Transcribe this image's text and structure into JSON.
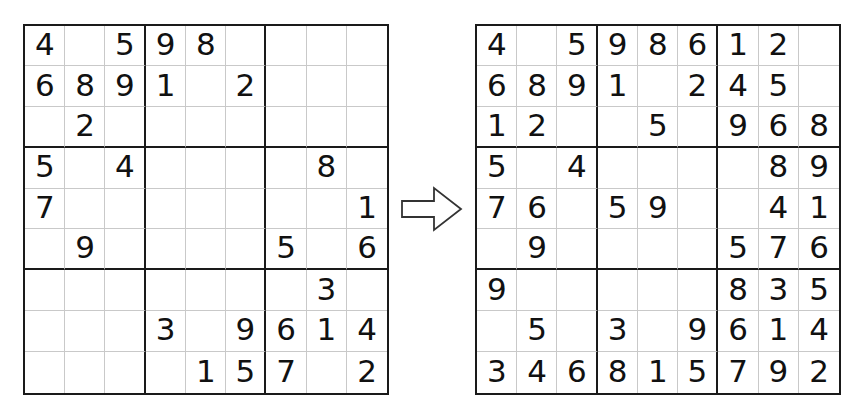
{
  "figure": {
    "arrow": {
      "name": "right-arrow",
      "direction": "right",
      "fill": "#ffffff",
      "stroke": "#333333"
    },
    "colors": {
      "page_background": "#ffffff",
      "grid_outer_border": "#1a1a1a",
      "grid_box_border": "#1a1a1a",
      "grid_cell_border": "#c9c9c9",
      "digit": "#111111"
    }
  },
  "grids": [
    {
      "name": "puzzle",
      "label": "Sudoku puzzle (givens)",
      "size": 9,
      "rows": [
        [
          "4",
          "",
          "5",
          "9",
          "8",
          "",
          "",
          "",
          ""
        ],
        [
          "6",
          "8",
          "9",
          "1",
          "",
          "2",
          "",
          "",
          ""
        ],
        [
          "",
          "2",
          "",
          "",
          "",
          "",
          "",
          "",
          ""
        ],
        [
          "5",
          "",
          "4",
          "",
          "",
          "",
          "",
          "8",
          ""
        ],
        [
          "7",
          "",
          "",
          "",
          "",
          "",
          "",
          "",
          "1"
        ],
        [
          "",
          "9",
          "",
          "",
          "",
          "",
          "5",
          "",
          "6"
        ],
        [
          "",
          "",
          "",
          "",
          "",
          "",
          "",
          "3",
          ""
        ],
        [
          "",
          "",
          "",
          "3",
          "",
          "9",
          "6",
          "1",
          "4"
        ],
        [
          "",
          "",
          "",
          "",
          "1",
          "5",
          "7",
          "",
          "2"
        ]
      ]
    },
    {
      "name": "solution",
      "label": "Sudoku partial solution",
      "size": 9,
      "rows": [
        [
          "4",
          "",
          "5",
          "9",
          "8",
          "6",
          "1",
          "2",
          ""
        ],
        [
          "6",
          "8",
          "9",
          "1",
          "",
          "2",
          "4",
          "5",
          ""
        ],
        [
          "1",
          "2",
          "",
          "",
          "5",
          "",
          "9",
          "6",
          "8"
        ],
        [
          "5",
          "",
          "4",
          "",
          "",
          "",
          "",
          "8",
          "9"
        ],
        [
          "7",
          "6",
          "",
          "5",
          "9",
          "",
          "",
          "4",
          "1"
        ],
        [
          "",
          "9",
          "",
          "",
          "",
          "",
          "5",
          "7",
          "6"
        ],
        [
          "9",
          "",
          "",
          "",
          "",
          "",
          "8",
          "3",
          "5"
        ],
        [
          "",
          "5",
          "",
          "3",
          "",
          "9",
          "6",
          "1",
          "4"
        ],
        [
          "3",
          "4",
          "6",
          "8",
          "1",
          "5",
          "7",
          "9",
          "2"
        ]
      ]
    }
  ]
}
